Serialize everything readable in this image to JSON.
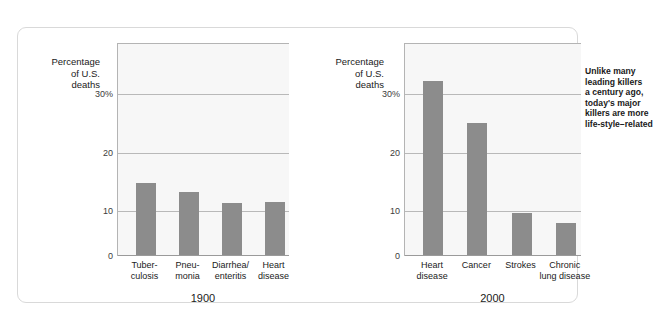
{
  "chart_data": [
    {
      "type": "bar",
      "title": "",
      "panel_label": "1900",
      "ylabel": "Percentage\nof U.S.\ndeaths",
      "xlabel": "",
      "categories": [
        "Tuber-\nculosis",
        "Pneu-\nmonia",
        "Diarrhea/\nenteritis",
        "Heart\ndisease"
      ],
      "category_names": [
        "Tuberculosis",
        "Pneumonia",
        "Diarrhea/enteritis",
        "Heart disease"
      ],
      "values": [
        12.5,
        11.0,
        9.0,
        9.2
      ],
      "ylim": [
        0,
        37
      ],
      "yticks": [
        0,
        10,
        20,
        30
      ],
      "ytick_labels": [
        "0",
        "10",
        "20",
        "30%"
      ],
      "grid": true,
      "legend": "none",
      "bar_color": "#8c8c8c"
    },
    {
      "type": "bar",
      "title": "",
      "panel_label": "2000",
      "ylabel": "Percentage\nof U.S.\ndeaths",
      "xlabel": "",
      "categories": [
        "Heart\ndisease",
        "Cancer",
        "Strokes",
        "Chronic\nlung disease"
      ],
      "category_names": [
        "Heart disease",
        "Cancer",
        "Strokes",
        "Chronic lung disease"
      ],
      "values": [
        30.3,
        23.0,
        7.3,
        5.6
      ],
      "ylim": [
        0,
        37
      ],
      "yticks": [
        0,
        10,
        20,
        30
      ],
      "ytick_labels": [
        "0",
        "10",
        "20",
        "30%"
      ],
      "grid": true,
      "legend": "none",
      "bar_color": "#8c8c8c",
      "annotation": "Unlike many\nleading killers\na century ago,\ntoday's major\nkillers are more\nlife-style–related"
    }
  ],
  "panels": {
    "left": {
      "axis_title": "Percentage\nof U.S.\ndeaths",
      "year": "1900",
      "ticks": {
        "t30": "30%",
        "t20": "20",
        "t10": "10",
        "t0": "0"
      },
      "cats": {
        "c0": "Tuber-\nculosis",
        "c1": "Pneu-\nmonia",
        "c2": "Diarrhea/\nenteritis",
        "c3": "Heart\ndisease"
      }
    },
    "right": {
      "axis_title": "Percentage\nof U.S.\ndeaths",
      "year": "2000",
      "annotation": "Unlike many\nleading killers\na century ago,\ntoday's major\nkillers are more\nlife-style–related",
      "ticks": {
        "t30": "30%",
        "t20": "20",
        "t10": "10",
        "t0": "0"
      },
      "cats": {
        "c0": "Heart\ndisease",
        "c1": "Cancer",
        "c2": "Strokes",
        "c3": "Chronic\nlung disease"
      }
    }
  }
}
